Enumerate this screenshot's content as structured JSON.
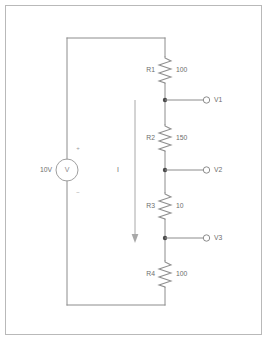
{
  "diagram": {
    "line_color": "#8c8c8c",
    "text_color": "#6e6e6e",
    "frame_color": "#b9b9b9",
    "background": "#ffffff"
  },
  "source": {
    "name": "V",
    "value_label": "10V",
    "symbol_letter": "V",
    "plus_sign": "+",
    "minus_sign": "−"
  },
  "current": {
    "label": "I",
    "direction": "down"
  },
  "resistors": [
    {
      "name": "R1",
      "value": "100",
      "cx": 165,
      "cy": 70
    },
    {
      "name": "R2",
      "value": "150",
      "cx": 165,
      "cy": 138
    },
    {
      "name": "R3",
      "value": "10",
      "cx": 165,
      "cy": 206
    },
    {
      "name": "R4",
      "value": "100",
      "cx": 165,
      "cy": 274
    }
  ],
  "nodes": [
    {
      "label": "V1",
      "y": 100
    },
    {
      "label": "V2",
      "y": 170
    },
    {
      "label": "V3",
      "y": 238
    }
  ]
}
